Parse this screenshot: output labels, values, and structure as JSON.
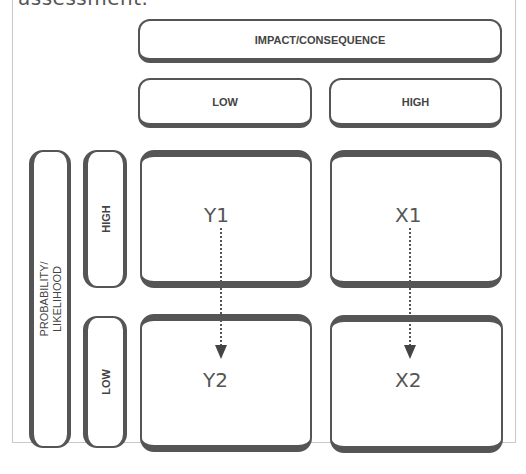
{
  "top_text": "assessment.",
  "matrix": {
    "column_axis_title": "IMPACT/CONSEQUENCE",
    "row_axis_title": "PROBABILITY/\nLIKELIHOOD",
    "columns": [
      "LOW",
      "HIGH"
    ],
    "rows": [
      "HIGH",
      "LOW"
    ],
    "cells": [
      {
        "row": "HIGH",
        "column": "LOW",
        "label": "Y1"
      },
      {
        "row": "HIGH",
        "column": "HIGH",
        "label": "X1"
      },
      {
        "row": "LOW",
        "column": "LOW",
        "label": "Y2"
      },
      {
        "row": "LOW",
        "column": "HIGH",
        "label": "X2"
      }
    ],
    "arrows": [
      {
        "from": "Y1",
        "to": "Y2",
        "style": "dotted"
      },
      {
        "from": "X1",
        "to": "X2",
        "style": "dotted"
      }
    ]
  },
  "colors": {
    "border": "#555555",
    "text": "#444444",
    "frame": "#c8c8c8"
  }
}
